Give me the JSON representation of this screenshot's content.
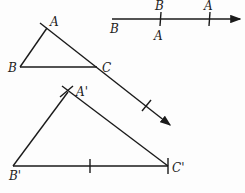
{
  "diagram": {
    "type": "geometry-construction",
    "ray": {
      "start_label": "B",
      "tick1_above": "B",
      "tick1_below": "A",
      "tick2_above": "A"
    },
    "triangle_original": {
      "vertices": {
        "A": "A",
        "B": "B",
        "C": "C"
      }
    },
    "triangle_constructed": {
      "vertices": {
        "A": "A'",
        "B": "B'",
        "C": "C'"
      }
    }
  }
}
